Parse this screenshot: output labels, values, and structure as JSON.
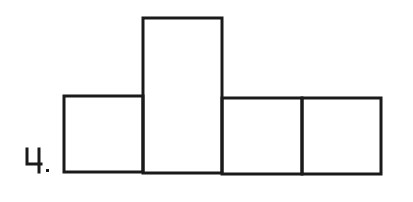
{
  "problem": {
    "number_label": "4.",
    "stroke_color": "#1a1a1a",
    "background": "#ffffff"
  },
  "figure": {
    "rectangles": [
      {
        "name": "box-1",
        "x": 64,
        "y": 96,
        "w": 79,
        "h": 76
      },
      {
        "name": "box-2-tall",
        "x": 143,
        "y": 18,
        "w": 79,
        "h": 155
      },
      {
        "name": "box-3",
        "x": 222,
        "y": 98,
        "w": 80,
        "h": 76
      },
      {
        "name": "box-4",
        "x": 302,
        "y": 98,
        "w": 79,
        "h": 76
      }
    ]
  }
}
